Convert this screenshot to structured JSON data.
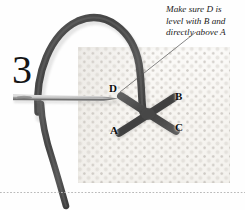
{
  "figure": {
    "step_number": "3"
  },
  "annotation": {
    "line1": "Make sure D is",
    "line2": "level with B and",
    "line3": "directly above A"
  },
  "labels": {
    "a": "A",
    "b": "B",
    "c": "C",
    "d": "D"
  },
  "colors": {
    "thread": "#4f4f4f",
    "thread_dark": "#3a3a3a",
    "needle": "#8e8e8e",
    "needle_highlight": "#d8d8d8",
    "fabric": "#f8f6f2",
    "fabric_dot": "#afaaa3",
    "text": "#151515",
    "divider": "#b9b9b9",
    "leader_line": "#555555"
  },
  "elements": {
    "needle_name": "sewing-needle",
    "thread_loop_name": "thread-loop",
    "thread_tail_name": "thread-tail",
    "stitch_name": "cross-stitch-x",
    "fabric_name": "aida-fabric",
    "leader_name": "annotation-leader-line"
  }
}
